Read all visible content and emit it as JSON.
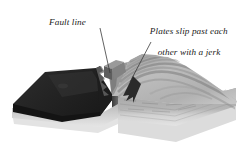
{
  "diagram": {
    "type": "geological-block-diagram",
    "background_color": "#ffffff",
    "labels": {
      "fault": {
        "text": "Fault line",
        "leader_from": [
          100,
          28
        ],
        "leader_to": [
          110,
          72
        ]
      },
      "plates": {
        "line1": "Plates slip past each",
        "line2": "other with a jerk",
        "leader_from": [
          151,
          42
        ],
        "leader_to": [
          129,
          84
        ]
      }
    },
    "blocks": {
      "left": {
        "name": "dark-slab",
        "top_color": "#272727",
        "side_color": "#141414",
        "front_color": "#9b9b9b",
        "base_color": "#dedede"
      },
      "right": {
        "name": "folded-terrain-block",
        "top_color": "#b4b4b4",
        "ridge_shadow": "#8d8d8d",
        "front_color": "#a8a8a8",
        "base_color": "#dcdcdc",
        "fault_face_color": "#4a4a4a"
      }
    },
    "arrow": {
      "name": "slip-arrow",
      "color": "#2b2b2b",
      "direction": "down-left"
    },
    "leader_color": "#3a3a3a"
  }
}
